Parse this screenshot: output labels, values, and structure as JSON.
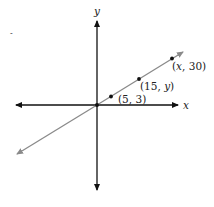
{
  "diagram": {
    "type": "coordinate-plane",
    "axes": {
      "x_label": "x",
      "y_label": "y",
      "axis_color": "#111111"
    },
    "line": {
      "color": "#8a8a8a",
      "passes_through_origin": true
    },
    "points": [
      {
        "label_open": "(",
        "label_x": "5",
        "label_sep": ", ",
        "label_y": "3",
        "label_close": ")",
        "text": "(5, 3)"
      },
      {
        "label_open": "(",
        "label_x": "15",
        "label_sep": ", ",
        "label_y": "y",
        "label_close": ")",
        "text": "(15, y)"
      },
      {
        "label_open": "(",
        "label_x": "x",
        "label_sep": ", ",
        "label_y": "30",
        "label_close": ")",
        "text": "(x, 30)"
      }
    ],
    "stray_mark": "-"
  }
}
